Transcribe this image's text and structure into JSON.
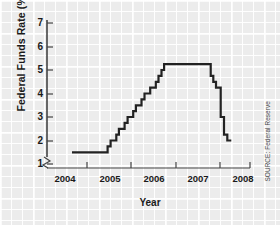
{
  "source_note": "SOURCE: Federal Reserve",
  "chart_data": {
    "type": "line",
    "step": "post",
    "title": "",
    "xlabel": "Year",
    "ylabel": "Federal Funds Rate (%)",
    "xlim": [
      2003.5,
      2008.5
    ],
    "ylim": [
      0.6,
      7.4
    ],
    "yticks": [
      1,
      2,
      3,
      4,
      5,
      6,
      7
    ],
    "ytick_labels": [
      "1",
      "2",
      "3",
      "4",
      "5",
      "6",
      "7"
    ],
    "xticks": [
      2004,
      2005,
      2006,
      2007,
      2008
    ],
    "xtick_labels": [
      "2004",
      "2005",
      "2006",
      "2007",
      "2008"
    ],
    "grid": false,
    "y_axis_break": true,
    "line_color": "#222222",
    "line_width": 2.2,
    "series": [
      {
        "name": "Federal Funds Rate",
        "x": [
          2003.55,
          2004.5,
          2004.62,
          2004.71,
          2004.8,
          2004.88,
          2004.96,
          2005.05,
          2005.13,
          2005.22,
          2005.3,
          2005.39,
          2005.47,
          2005.56,
          2005.64,
          2005.73,
          2005.81,
          2005.9,
          2005.98,
          2006.07,
          2006.15,
          2006.24,
          2006.32,
          2007.62,
          2007.72,
          2007.8,
          2007.88,
          2008.02,
          2008.12,
          2008.22
        ],
        "values": [
          1.5,
          1.5,
          1.75,
          2.0,
          2.0,
          2.25,
          2.5,
          2.5,
          2.75,
          3.0,
          3.0,
          3.25,
          3.5,
          3.5,
          3.75,
          4.0,
          4.0,
          4.25,
          4.25,
          4.5,
          4.75,
          5.0,
          5.25,
          5.25,
          4.75,
          4.5,
          4.25,
          3.0,
          2.25,
          2.0
        ]
      }
    ],
    "annotations": {
      "trough_rate": 1.5,
      "peak_rate": 5.25,
      "final_rate": 2.0
    }
  }
}
